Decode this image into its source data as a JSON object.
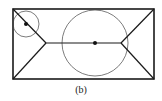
{
  "figure": {
    "caption": "(b)",
    "stroke_color": "#1a1a1a",
    "rectangle": {
      "x": 13,
      "y": 9,
      "width": 141,
      "height": 70
    },
    "small_circle": {
      "cx": 26,
      "cy": 24,
      "r": 13
    },
    "large_circle": {
      "cx": 95,
      "cy": 43,
      "r": 33
    },
    "left_junction": {
      "x": 46,
      "y": 43
    },
    "right_junction": {
      "x": 121,
      "y": 43
    }
  }
}
